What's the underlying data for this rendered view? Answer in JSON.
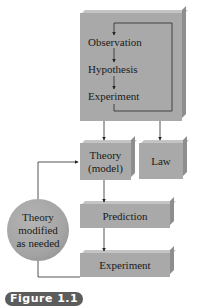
{
  "diagram": {
    "top_box": {
      "steps": [
        "Observation",
        "Hypothesis",
        "Experiment"
      ]
    },
    "theory_box": {
      "line1": "Theory",
      "line2": "(model)"
    },
    "law_box": {
      "label": "Law"
    },
    "prediction_box": {
      "label": "Prediction"
    },
    "experiment_box": {
      "label": "Experiment"
    },
    "modify_circle": {
      "line1": "Theory",
      "line2": "modified",
      "line3": "as needed"
    },
    "colors": {
      "box_fill": "#a9a9a9",
      "line": "#333333",
      "badge": "#5c5c5c"
    }
  },
  "caption": {
    "figure_label": "Figure 1.1"
  }
}
